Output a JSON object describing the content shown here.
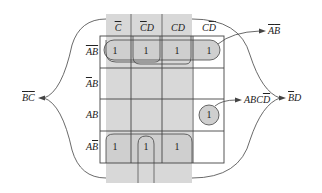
{
  "kmap": {
    "columns": [
      {
        "label": "CD",
        "overline": [
          true,
          true
        ]
      },
      {
        "label": "CD",
        "overline": [
          true,
          false
        ]
      },
      {
        "label": "CD",
        "overline": [
          false,
          false
        ]
      },
      {
        "label": "CD",
        "overline": [
          false,
          true
        ]
      }
    ],
    "rows": [
      {
        "label": "AB",
        "overline": [
          true,
          true
        ]
      },
      {
        "label": "AB",
        "overline": [
          true,
          false
        ]
      },
      {
        "label": "AB",
        "overline": [
          false,
          false
        ]
      },
      {
        "label": "AB",
        "overline": [
          false,
          true
        ]
      }
    ],
    "cells": [
      [
        "1",
        "1",
        "1",
        "1"
      ],
      [
        "",
        "",
        "",
        ""
      ],
      [
        "",
        "",
        "",
        "1"
      ],
      [
        "1",
        "1",
        "1",
        ""
      ]
    ]
  },
  "terms": {
    "left": "BC",
    "top_right": "AB",
    "mid_right": "ABCD",
    "far_right": "BD"
  },
  "colors": {
    "shade": "#d6d6d6",
    "line": "#444444"
  }
}
